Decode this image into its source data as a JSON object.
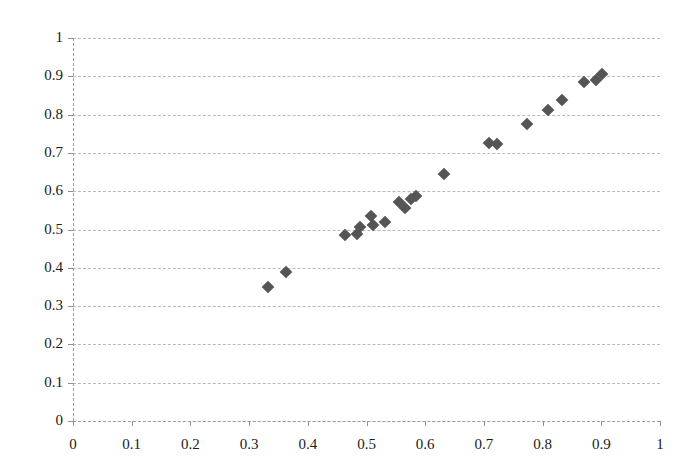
{
  "chart_data": {
    "type": "scatter",
    "title": "",
    "xlabel": "",
    "ylabel": "",
    "xlim": [
      0,
      1
    ],
    "ylim": [
      0,
      1
    ],
    "grid": true,
    "legend": null,
    "marker": "diamond",
    "marker_color": "#555555",
    "xticks": [
      "0",
      "0.1",
      "0.2",
      "0.3",
      "0.4",
      "0.5",
      "0.6",
      "0.7",
      "0.8",
      "0.9",
      "1"
    ],
    "yticks": [
      "0",
      "0.1",
      "0.2",
      "0.3",
      "0.4",
      "0.5",
      "0.6",
      "0.7",
      "0.8",
      "0.9",
      "1"
    ],
    "xtick_values": [
      0,
      0.1,
      0.2,
      0.3,
      0.4,
      0.5,
      0.6,
      0.7,
      0.8,
      0.9,
      1
    ],
    "ytick_values": [
      0,
      0.1,
      0.2,
      0.3,
      0.4,
      0.5,
      0.6,
      0.7,
      0.8,
      0.9,
      1
    ],
    "points": [
      {
        "x": 0.332,
        "y": 0.349
      },
      {
        "x": 0.363,
        "y": 0.388
      },
      {
        "x": 0.464,
        "y": 0.486
      },
      {
        "x": 0.484,
        "y": 0.489
      },
      {
        "x": 0.489,
        "y": 0.507
      },
      {
        "x": 0.508,
        "y": 0.536
      },
      {
        "x": 0.511,
        "y": 0.513
      },
      {
        "x": 0.531,
        "y": 0.52
      },
      {
        "x": 0.556,
        "y": 0.572
      },
      {
        "x": 0.566,
        "y": 0.557
      },
      {
        "x": 0.575,
        "y": 0.58
      },
      {
        "x": 0.584,
        "y": 0.588
      },
      {
        "x": 0.632,
        "y": 0.644
      },
      {
        "x": 0.709,
        "y": 0.727
      },
      {
        "x": 0.722,
        "y": 0.723
      },
      {
        "x": 0.774,
        "y": 0.775
      },
      {
        "x": 0.81,
        "y": 0.812
      },
      {
        "x": 0.833,
        "y": 0.838
      },
      {
        "x": 0.871,
        "y": 0.885
      },
      {
        "x": 0.891,
        "y": 0.89
      },
      {
        "x": 0.901,
        "y": 0.905
      }
    ]
  }
}
